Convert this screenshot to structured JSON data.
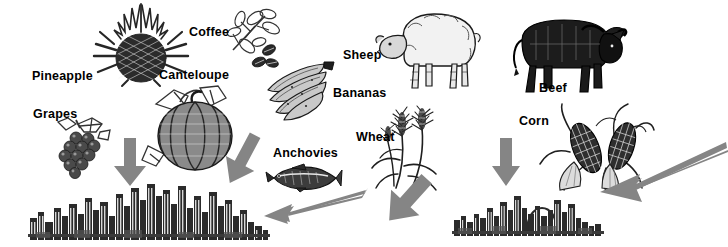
{
  "scene": {
    "title": "Food commodities flowing into cities",
    "background_color": "#ffffff",
    "ink_color": "#1a1a1a",
    "arrow_color": "#808080",
    "width": 724,
    "height": 247
  },
  "labels": [
    {
      "id": "pineapple",
      "text": "Pineapple",
      "x": 32,
      "y": 70
    },
    {
      "id": "grapes",
      "text": "Grapes",
      "x": 33,
      "y": 108
    },
    {
      "id": "coffee",
      "text": "Coffee",
      "x": 189,
      "y": 26
    },
    {
      "id": "canteloupe",
      "text": "Canteloupe",
      "x": 159,
      "y": 69
    },
    {
      "id": "bananas",
      "text": "Bananas",
      "x": 333,
      "y": 87
    },
    {
      "id": "anchovies",
      "text": "Anchovies",
      "x": 273,
      "y": 147
    },
    {
      "id": "sheep",
      "text": "Sheep",
      "x": 343,
      "y": 49
    },
    {
      "id": "beef",
      "text": "Beef",
      "x": 539,
      "y": 82
    },
    {
      "id": "wheat",
      "text": "Wheat",
      "x": 356,
      "y": 131
    },
    {
      "id": "corn",
      "text": "Corn",
      "x": 519,
      "y": 115
    }
  ],
  "illustrations": [
    {
      "id": "pineapple-illustration",
      "name": "pineapple"
    },
    {
      "id": "grapes-illustration",
      "name": "grape-bunch"
    },
    {
      "id": "coffee-illustration",
      "name": "coffee-branch-and-beans"
    },
    {
      "id": "canteloupe-illustration",
      "name": "canteloupe-melon"
    },
    {
      "id": "bananas-illustration",
      "name": "banana-bunch"
    },
    {
      "id": "anchovies-illustration",
      "name": "anchovy-fish"
    },
    {
      "id": "sheep-illustration",
      "name": "sheep"
    },
    {
      "id": "beef-illustration",
      "name": "bull"
    },
    {
      "id": "wheat-illustration",
      "name": "wheat-stalks"
    },
    {
      "id": "corn-illustration",
      "name": "corn-ears"
    },
    {
      "id": "left-city",
      "name": "city-skyline-left"
    },
    {
      "id": "right-city",
      "name": "city-skyline-right"
    }
  ],
  "arrows": [
    {
      "id": "arrow-grapes-to-left-city",
      "from": "grapes",
      "to": "left-city",
      "direction": "down"
    },
    {
      "id": "arrow-canteloupe-to-left-city",
      "from": "canteloupe",
      "to": "left-city",
      "direction": "down-right"
    },
    {
      "id": "arrow-anchovies-to-left-city",
      "from": "anchovies",
      "to": "left-city",
      "direction": "down-left"
    },
    {
      "id": "arrow-wheat-to-right-city",
      "from": "wheat",
      "to": "right-city",
      "direction": "down-right"
    },
    {
      "id": "arrow-corn-to-right-city",
      "from": "corn",
      "to": "right-city",
      "direction": "down"
    },
    {
      "id": "arrow-offscreen-to-right-city",
      "from": "off-screen-right",
      "to": "right-city",
      "direction": "down-left"
    }
  ]
}
